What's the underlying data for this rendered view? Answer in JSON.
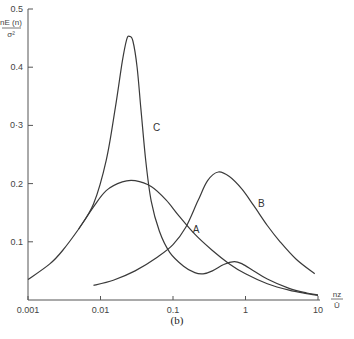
{
  "chart_data": {
    "type": "line",
    "title": "",
    "panel_label": "(b)",
    "xlabel": {
      "numerator": "nz",
      "denominator": "Ū"
    },
    "ylabel": {
      "numerator": "nE (n)",
      "denominator": "σ²"
    },
    "xscale": "log",
    "xlim": [
      0.001,
      10
    ],
    "ylim": [
      0,
      0.5
    ],
    "grid": false,
    "x_ticks": [
      {
        "value": 0.001,
        "label": "0.001"
      },
      {
        "value": 0.01,
        "label": "0.01"
      },
      {
        "value": 0.1,
        "label": "0.1"
      },
      {
        "value": 1,
        "label": "1"
      },
      {
        "value": 10,
        "label": "10"
      }
    ],
    "y_ticks": [
      {
        "value": 0.1,
        "label": "0.1"
      },
      {
        "value": 0.2,
        "label": "0.2"
      },
      {
        "value": 0.3,
        "label": "0·3"
      },
      {
        "value": 0.4,
        "label": "0.4"
      },
      {
        "value": 0.5,
        "label": "0.5"
      }
    ],
    "series": [
      {
        "name": "A",
        "label_at": [
          0.17,
          0.115
        ],
        "points": [
          [
            0.001,
            0.035
          ],
          [
            0.002,
            0.062
          ],
          [
            0.003,
            0.085
          ],
          [
            0.005,
            0.122
          ],
          [
            0.008,
            0.16
          ],
          [
            0.012,
            0.188
          ],
          [
            0.02,
            0.203
          ],
          [
            0.03,
            0.205
          ],
          [
            0.05,
            0.195
          ],
          [
            0.08,
            0.172
          ],
          [
            0.12,
            0.145
          ],
          [
            0.2,
            0.113
          ],
          [
            0.35,
            0.085
          ],
          [
            0.6,
            0.062
          ],
          [
            1,
            0.045
          ],
          [
            2,
            0.028
          ],
          [
            4,
            0.017
          ],
          [
            7,
            0.011
          ],
          [
            10,
            0.008
          ]
        ]
      },
      {
        "name": "B",
        "label_at": [
          1.35,
          0.16
        ],
        "points": [
          [
            0.008,
            0.025
          ],
          [
            0.015,
            0.034
          ],
          [
            0.03,
            0.05
          ],
          [
            0.06,
            0.073
          ],
          [
            0.1,
            0.095
          ],
          [
            0.15,
            0.125
          ],
          [
            0.22,
            0.17
          ],
          [
            0.3,
            0.205
          ],
          [
            0.42,
            0.22
          ],
          [
            0.6,
            0.212
          ],
          [
            0.9,
            0.19
          ],
          [
            1.3,
            0.162
          ],
          [
            2,
            0.128
          ],
          [
            3,
            0.1
          ],
          [
            5,
            0.07
          ],
          [
            9,
            0.045
          ]
        ]
      },
      {
        "name": "C",
        "label_at": [
          0.048,
          0.29
        ],
        "points": [
          [
            0.005,
            0.122
          ],
          [
            0.008,
            0.165
          ],
          [
            0.012,
            0.24
          ],
          [
            0.016,
            0.33
          ],
          [
            0.02,
            0.41
          ],
          [
            0.023,
            0.448
          ],
          [
            0.025,
            0.453
          ],
          [
            0.028,
            0.445
          ],
          [
            0.032,
            0.4
          ],
          [
            0.036,
            0.33
          ],
          [
            0.042,
            0.24
          ],
          [
            0.05,
            0.17
          ],
          [
            0.065,
            0.118
          ],
          [
            0.09,
            0.082
          ],
          [
            0.14,
            0.058
          ],
          [
            0.2,
            0.047
          ],
          [
            0.26,
            0.045
          ],
          [
            0.35,
            0.05
          ],
          [
            0.5,
            0.061
          ],
          [
            0.7,
            0.066
          ],
          [
            0.9,
            0.062
          ],
          [
            1.3,
            0.05
          ],
          [
            2,
            0.036
          ],
          [
            4,
            0.02
          ],
          [
            7,
            0.012
          ],
          [
            10,
            0.009
          ]
        ]
      }
    ]
  },
  "caption": "(b)"
}
